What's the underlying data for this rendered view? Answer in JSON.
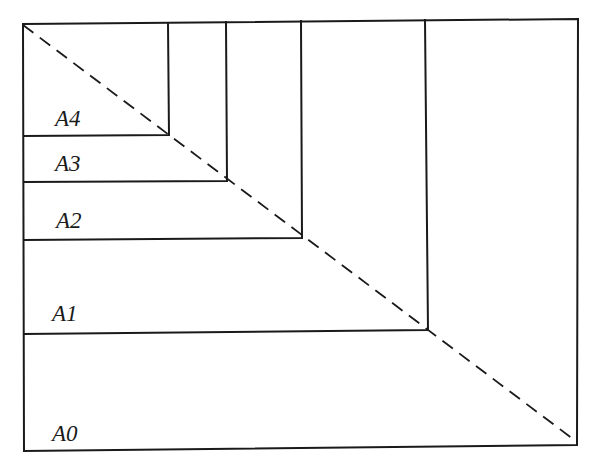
{
  "diagram": {
    "labels": {
      "a0": "A0",
      "a1": "A1",
      "a2": "A2",
      "a3": "A3",
      "a4": "A4"
    },
    "sheets": [
      {
        "name": "A0",
        "x1": 23,
        "y1": 21,
        "x2": 578,
        "y2": 448
      },
      {
        "name": "A1",
        "right_x": 428,
        "bottom_y": 330
      },
      {
        "name": "A2",
        "right_x": 302,
        "bottom_y": 238
      },
      {
        "name": "A3",
        "right_x": 227,
        "bottom_y": 181
      },
      {
        "name": "A4",
        "right_x": 168,
        "bottom_y": 135
      }
    ],
    "diagonal": {
      "style": "dashed",
      "from": [
        23,
        24
      ],
      "to": [
        577,
        442
      ]
    },
    "colors": {
      "line": "#1a1a1a",
      "background": "#ffffff"
    }
  }
}
